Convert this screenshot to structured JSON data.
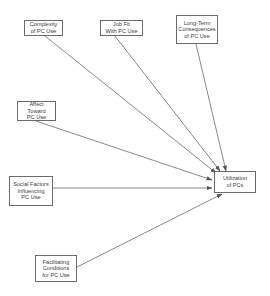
{
  "diagram": {
    "type": "path-model",
    "nodes": [
      {
        "id": "complexity",
        "label": "Complexity\nof PC Use"
      },
      {
        "id": "jobfit",
        "label": "Job Fit\nWith PC Use"
      },
      {
        "id": "longterm",
        "label": "Long-Term\nConsequences\nof PC Use"
      },
      {
        "id": "affect",
        "label": "Affect Toward\nPC Use"
      },
      {
        "id": "social",
        "label": "Social Factors\nInfluencing\nPC Use"
      },
      {
        "id": "facilitating",
        "label": "Facilitating\nConditions\nfor PC Use"
      },
      {
        "id": "utilization",
        "label": "Utilization\nof PCs"
      }
    ],
    "edges": [
      {
        "from": "complexity",
        "to": "utilization"
      },
      {
        "from": "jobfit",
        "to": "utilization"
      },
      {
        "from": "longterm",
        "to": "utilization"
      },
      {
        "from": "affect",
        "to": "utilization"
      },
      {
        "from": "social",
        "to": "utilization"
      },
      {
        "from": "facilitating",
        "to": "utilization"
      }
    ],
    "colors": {
      "line": "#555555",
      "border": "#6a6a6a",
      "text": "#3a3a3a",
      "background": "#ffffff"
    }
  }
}
